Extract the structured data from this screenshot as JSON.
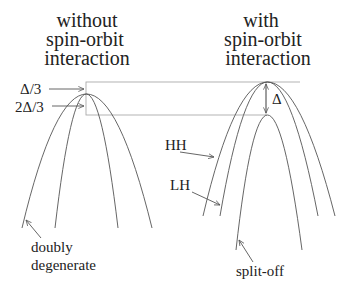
{
  "left_panel": {
    "title_lines": [
      "without",
      "spin-orbit",
      "interaction"
    ],
    "level_labels": [
      "Δ/3",
      "2Δ/3"
    ],
    "band_label_lines": [
      "doubly",
      "degenerate"
    ]
  },
  "right_panel": {
    "title_lines": [
      "with",
      "spin-orbit",
      "interaction"
    ],
    "splitting_label": "Δ",
    "band_labels": {
      "heavy_hole": "HH",
      "light_hole": "LH",
      "split_off": "split-off"
    }
  }
}
